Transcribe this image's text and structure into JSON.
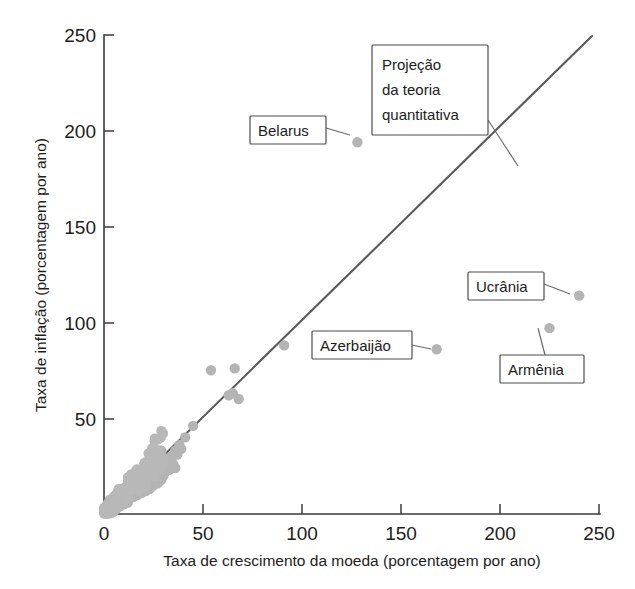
{
  "chart_data": {
    "type": "scatter",
    "title": "",
    "xlabel": "Taxa de crescimento da moeda (porcentagem por ano)",
    "ylabel": "Taxa de inflação (porcentagem por ano)",
    "xlim": [
      0,
      250
    ],
    "ylim": [
      0,
      250
    ],
    "xticks": [
      0,
      50,
      100,
      150,
      200,
      250
    ],
    "yticks": [
      0,
      50,
      100,
      150,
      200,
      250
    ],
    "xtick_labels": [
      "0",
      "50",
      "100",
      "150",
      "200",
      "250"
    ],
    "ytick_labels": [
      "0",
      "50",
      "100",
      "150",
      "200",
      "250"
    ],
    "grid": false,
    "legend": false,
    "series": [
      {
        "name": "Países",
        "marker": "circle",
        "color": "#b4b4b4",
        "points": [
          [
            128,
            194
          ],
          [
            240,
            114
          ],
          [
            225,
            97
          ],
          [
            168,
            86
          ],
          [
            91,
            88
          ],
          [
            66,
            76
          ],
          [
            54,
            75
          ],
          [
            65,
            63
          ],
          [
            68,
            60
          ],
          [
            63,
            62
          ],
          [
            45,
            46
          ],
          [
            41,
            40
          ],
          [
            38,
            36
          ],
          [
            36,
            33
          ],
          [
            34,
            30
          ],
          [
            32,
            29
          ],
          [
            30,
            28
          ],
          [
            31,
            25
          ],
          [
            29,
            33
          ],
          [
            27,
            30
          ],
          [
            28,
            22
          ],
          [
            26,
            24
          ],
          [
            25,
            27
          ],
          [
            24,
            21
          ],
          [
            23,
            19
          ],
          [
            22,
            23
          ],
          [
            21,
            18
          ],
          [
            20,
            20
          ],
          [
            19,
            17
          ],
          [
            18,
            16
          ],
          [
            17,
            18
          ],
          [
            16,
            15
          ],
          [
            15,
            14
          ],
          [
            14,
            16
          ],
          [
            13,
            13
          ],
          [
            12,
            12
          ],
          [
            12,
            15
          ],
          [
            11,
            11
          ],
          [
            10,
            12
          ],
          [
            10,
            9
          ],
          [
            9,
            10
          ],
          [
            9,
            8
          ],
          [
            8,
            9
          ],
          [
            8,
            7
          ],
          [
            7,
            8
          ],
          [
            7,
            6
          ],
          [
            6,
            7
          ],
          [
            6,
            5
          ],
          [
            5,
            6
          ],
          [
            5,
            4
          ],
          [
            4,
            5
          ],
          [
            4,
            3
          ],
          [
            3,
            4
          ],
          [
            3,
            2
          ],
          [
            2,
            3
          ],
          [
            2,
            2
          ],
          [
            1,
            2
          ],
          [
            1,
            1
          ],
          [
            14,
            10
          ],
          [
            16,
            11
          ],
          [
            18,
            12
          ],
          [
            20,
            13
          ],
          [
            22,
            14
          ],
          [
            13,
            8
          ],
          [
            11,
            7
          ],
          [
            15,
            9
          ],
          [
            17,
            10
          ],
          [
            19,
            11
          ],
          [
            21,
            12
          ],
          [
            23,
            13
          ],
          [
            12,
            6
          ],
          [
            10,
            5
          ],
          [
            8,
            4
          ],
          [
            6,
            3
          ],
          [
            24,
            16
          ],
          [
            26,
            18
          ],
          [
            28,
            17
          ],
          [
            30,
            20
          ],
          [
            33,
            23
          ],
          [
            35,
            26
          ],
          [
            37,
            31
          ],
          [
            25,
            15
          ],
          [
            27,
            16
          ],
          [
            29,
            18
          ],
          [
            9,
            13
          ],
          [
            11,
            14
          ],
          [
            7,
            11
          ],
          [
            5,
            9
          ],
          [
            13,
            17
          ],
          [
            15,
            19
          ],
          [
            6,
            10
          ],
          [
            4,
            7
          ],
          [
            3,
            6
          ],
          [
            2,
            5
          ],
          [
            17,
            13
          ],
          [
            19,
            14
          ],
          [
            21,
            16
          ],
          [
            23,
            17
          ],
          [
            31,
            22
          ],
          [
            34,
            27
          ],
          [
            36,
            24
          ],
          [
            39,
            34
          ]
        ]
      }
    ],
    "reference_line": {
      "name": "Projeção da teoria quantitativa",
      "from": [
        0,
        0
      ],
      "to": [
        250,
        250
      ],
      "color": "#5a5a5a"
    },
    "annotations": [
      {
        "id": "projecao",
        "lines": [
          "Projeção",
          "da teoria",
          "quantitativa"
        ],
        "box": {
          "x": 372,
          "y": 45,
          "w": 116,
          "h": 90
        },
        "leader_to": {
          "x": 518,
          "y": 166
        }
      },
      {
        "id": "belarus",
        "lines": [
          "Belarus"
        ],
        "box": {
          "x": 250,
          "y": 116,
          "w": 76,
          "h": 28
        },
        "leader_to": {
          "x": 350,
          "y": 135
        },
        "data_point": [
          128,
          194
        ]
      },
      {
        "id": "ucrania",
        "lines": [
          "Ucrânia"
        ],
        "box": {
          "x": 468,
          "y": 272,
          "w": 76,
          "h": 28
        },
        "leader_to": {
          "x": 570,
          "y": 294
        },
        "data_point": [
          240,
          114
        ]
      },
      {
        "id": "armenia",
        "lines": [
          "Armênia"
        ],
        "box": {
          "x": 500,
          "y": 355,
          "w": 84,
          "h": 28
        },
        "leader_to": {
          "x": 538,
          "y": 328
        },
        "data_point": [
          225,
          97
        ]
      },
      {
        "id": "azerbaijao",
        "lines": [
          "Azerbaijão"
        ],
        "box": {
          "x": 312,
          "y": 331,
          "w": 100,
          "h": 28
        },
        "leader_to": {
          "x": 431,
          "y": 349
        },
        "data_point": [
          168,
          86
        ]
      }
    ]
  },
  "axes": {
    "y_title": "Taxa de inflação (porcentagem por ano)",
    "x_title": "Taxa de crescimento da moeda (porcentagem por ano)",
    "x_tick_labels": [
      "0",
      "50",
      "100",
      "150",
      "200",
      "250"
    ],
    "y_tick_labels": [
      "0",
      "50",
      "100",
      "150",
      "200",
      "250"
    ]
  },
  "callouts": {
    "projecao_line1": "Projeção",
    "projecao_line2": "da teoria",
    "projecao_line3": "quantitativa",
    "belarus": "Belarus",
    "ucrania": "Ucrânia",
    "armenia": "Armênia",
    "azerbaijao": "Azerbaijão"
  },
  "colors": {
    "point": "#b4b4b4",
    "line": "#5a5a5a",
    "axis": "#3b3b3b",
    "text": "#1c1c1c",
    "box_border": "#4d4d4d"
  }
}
